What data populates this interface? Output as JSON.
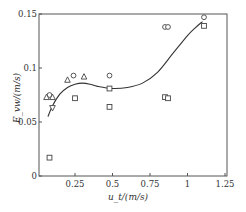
{
  "chart_data": {
    "type": "scatter",
    "title": "",
    "xlabel": "u_t/(m/s)",
    "ylabel": "E_vw/(m/s)",
    "xlim": [
      0.01,
      1.26
    ],
    "ylim": [
      0,
      0.15
    ],
    "xticks": [
      0.25,
      0.5,
      0.75,
      1,
      1.25
    ],
    "xtick_labels": [
      "0.25",
      "0.5",
      "0.75",
      "1",
      "1.25"
    ],
    "yticks": [
      0,
      0.05,
      0.1,
      0.15
    ],
    "ytick_labels": [
      "0",
      "0.05",
      "0.1",
      "0.15"
    ],
    "grid": false,
    "legend": null,
    "series": [
      {
        "name": "circles",
        "marker": "circle",
        "points": [
          [
            0.08,
            0.075
          ],
          [
            0.24,
            0.093
          ],
          [
            0.48,
            0.093
          ],
          [
            0.85,
            0.138
          ],
          [
            0.87,
            0.138
          ],
          [
            1.11,
            0.147
          ]
        ]
      },
      {
        "name": "squares",
        "marker": "square",
        "points": [
          [
            0.08,
            0.017
          ],
          [
            0.25,
            0.072
          ],
          [
            0.48,
            0.081
          ],
          [
            0.48,
            0.064
          ],
          [
            0.85,
            0.073
          ],
          [
            0.87,
            0.072
          ],
          [
            1.11,
            0.139
          ]
        ]
      },
      {
        "name": "triangles",
        "marker": "triangle-up",
        "points": [
          [
            0.06,
            0.073
          ],
          [
            0.1,
            0.073
          ],
          [
            0.2,
            0.089
          ],
          [
            0.31,
            0.092
          ]
        ]
      },
      {
        "name": "inverted-triangles",
        "marker": "triangle-down",
        "points": [
          [
            0.1,
            0.063
          ]
        ]
      }
    ],
    "fit_curve": {
      "name": "fitted curve",
      "points": [
        [
          0.07,
          0.055
        ],
        [
          0.1,
          0.065
        ],
        [
          0.15,
          0.076
        ],
        [
          0.2,
          0.082
        ],
        [
          0.25,
          0.085
        ],
        [
          0.3,
          0.086
        ],
        [
          0.35,
          0.085
        ],
        [
          0.4,
          0.083
        ],
        [
          0.5,
          0.081
        ],
        [
          0.6,
          0.082
        ],
        [
          0.7,
          0.086
        ],
        [
          0.8,
          0.096
        ],
        [
          0.9,
          0.113
        ],
        [
          1.0,
          0.13
        ],
        [
          1.05,
          0.137
        ],
        [
          1.1,
          0.143
        ]
      ]
    }
  }
}
